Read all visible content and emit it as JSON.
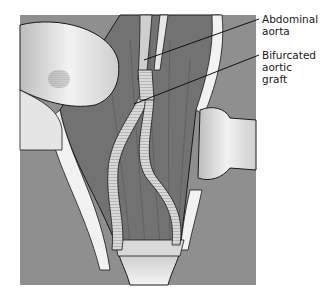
{
  "figure": {
    "colors": {
      "background_tissue": "#8f8f8f",
      "muscle": "#7a7a7a",
      "retractor": "#e8e8e8",
      "fat_edge": "#f4f4f4",
      "outline": "#1a1a1a"
    },
    "labels": [
      {
        "id": "abdominal-aorta",
        "text": "Abdominal\naorta"
      },
      {
        "id": "bifurcated-aortic-graft",
        "text": "Bifurcated\naortic graft"
      }
    ]
  }
}
